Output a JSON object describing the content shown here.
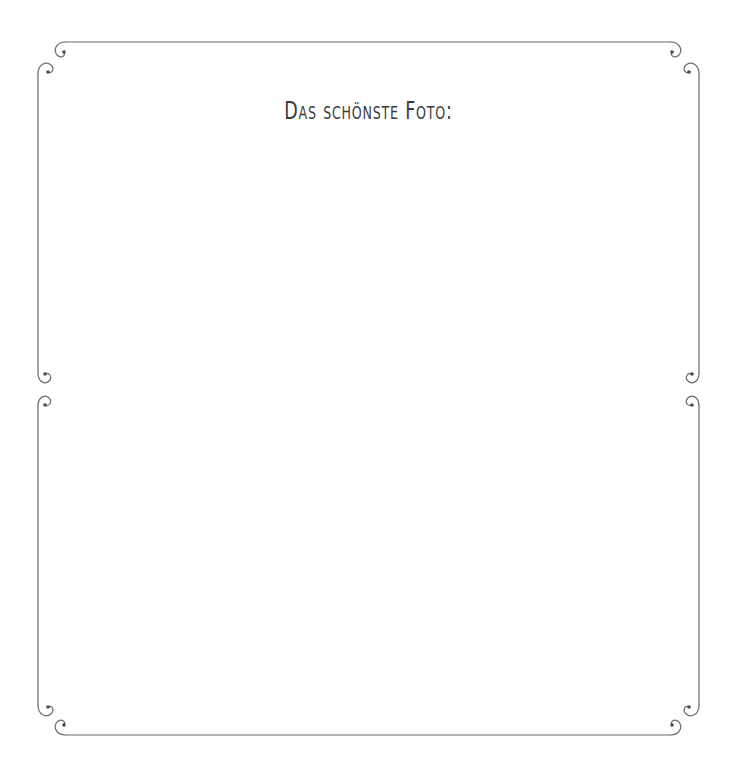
{
  "page": {
    "title": "Das schönste Foto:",
    "frame_color": "#6a6a6a",
    "background": "#ffffff"
  },
  "frames": [
    {
      "name": "upper-photo-frame"
    },
    {
      "name": "lower-photo-frame"
    }
  ]
}
